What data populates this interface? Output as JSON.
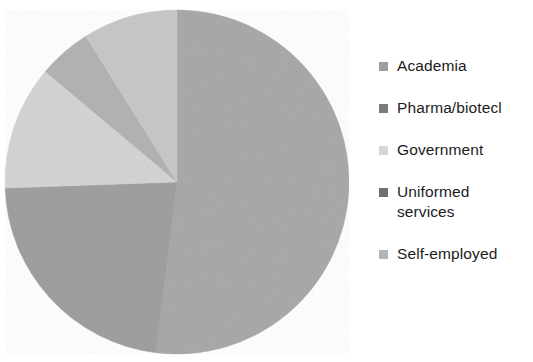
{
  "chart_data": {
    "type": "pie",
    "title": "",
    "subtitle": "",
    "xlabel": "",
    "ylabel": "",
    "grid": false,
    "legend_position": "right",
    "start_angle_deg": 0,
    "direction": "clockwise",
    "categories": [
      "Academia",
      "Pharma/biotech",
      "Government",
      "Uniformed services",
      "Self-employed"
    ],
    "values": [
      52,
      9,
      12,
      5,
      22
    ],
    "units": "percent",
    "slices": [
      {
        "label": "Academia",
        "value": 52,
        "color": "#a6a6a6",
        "start_angle_deg": 0,
        "end_angle_deg": 187
      },
      {
        "label": "Self-employed",
        "value": 22,
        "color": "#9c9c9c",
        "start_angle_deg": 187,
        "end_angle_deg": 268
      },
      {
        "label": "Government",
        "value": 12,
        "color": "#d3d3d3",
        "start_angle_deg": 268,
        "end_angle_deg": 310
      },
      {
        "label": "Uniformed services",
        "value": 5,
        "color": "#b0b0b0",
        "start_angle_deg": 310,
        "end_angle_deg": 328
      },
      {
        "label": "Pharma/biotech",
        "value": 9,
        "color": "#c6c6c6",
        "start_angle_deg": 328,
        "end_angle_deg": 360
      }
    ]
  },
  "pie": {
    "center_x": 177,
    "center_y": 182,
    "radius": 172
  },
  "legend": {
    "items": [
      {
        "label": "Academia",
        "swatch_color": "#9e9e9e"
      },
      {
        "label": "Pharma/biotecl",
        "swatch_color": "#7b7b7b"
      },
      {
        "label": "Government",
        "swatch_color": "#d6d6d6"
      },
      {
        "label": "Uniformed",
        "label_line2": "services",
        "swatch_color": "#6f6f6f"
      },
      {
        "label": "Self-employed",
        "swatch_color": "#b4b4b4"
      }
    ]
  }
}
